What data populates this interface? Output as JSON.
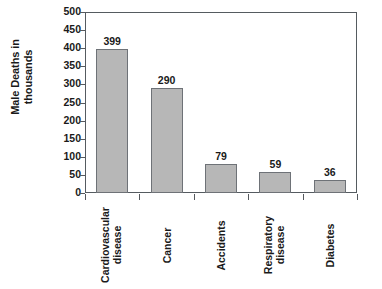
{
  "chart_data": {
    "type": "bar",
    "title": "",
    "subtitle": "",
    "xlabel": "",
    "ylabel": "Male Deaths in thousands",
    "ylabel_lines": [
      "Male Deaths in",
      "thousands"
    ],
    "categories": [
      "Cardiovascular disease",
      "Cancer",
      "Accidents",
      "Respiratory disease",
      "Diabetes"
    ],
    "category_lines": [
      [
        "Cardiovascular",
        "disease"
      ],
      [
        "Cancer"
      ],
      [
        "Accidents"
      ],
      [
        "Respiratory",
        "disease"
      ],
      [
        "Diabetes"
      ]
    ],
    "values": [
      399,
      290,
      79,
      59,
      36
    ],
    "value_labels": [
      "399",
      "290",
      "79",
      "59",
      "36"
    ],
    "ylim": [
      0,
      500
    ],
    "ytick_values": [
      0,
      50,
      100,
      150,
      200,
      250,
      300,
      350,
      400,
      450,
      500
    ],
    "ytick_labels": [
      "0",
      "50",
      "100",
      "150",
      "200",
      "250",
      "300",
      "350",
      "400",
      "450",
      "500"
    ],
    "grid": false,
    "legend": null,
    "bar_color": "#b7b7b7",
    "bar_border_color": "#6e7277",
    "axis_color": "#55595e",
    "text_color": "#1a1a1a"
  }
}
